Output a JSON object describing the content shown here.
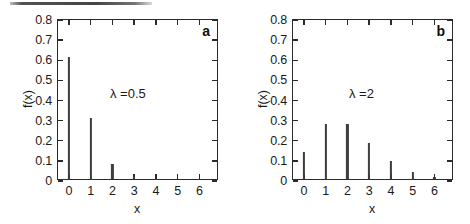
{
  "figure": {
    "background": "#ffffff",
    "axis_color": "#2b2b2b",
    "stem_color": "#3d3d3d"
  },
  "artifact": {
    "name": "scan-line"
  },
  "panels": [
    {
      "letter": "a",
      "lambda_label": "λ =0.5",
      "xlabel": "x",
      "ylabel": "f(x)"
    },
    {
      "letter": "b",
      "lambda_label": "λ =2",
      "xlabel": "x",
      "ylabel": "f(x)"
    }
  ],
  "axes": {
    "y_ticks": [
      "0",
      "0.1",
      "0.2",
      "0.3",
      "0.4",
      "0.5",
      "0.6",
      "0.7",
      "0.8"
    ],
    "y_tick_values": [
      0,
      0.1,
      0.2,
      0.3,
      0.4,
      0.5,
      0.6,
      0.7,
      0.8
    ],
    "x_ticks": [
      "0",
      "1",
      "2",
      "3",
      "4",
      "5",
      "6"
    ],
    "x_tick_values": [
      0,
      1,
      2,
      3,
      4,
      5,
      6
    ]
  },
  "chart_data": [
    {
      "type": "bar",
      "title": "a",
      "annotation": "λ =0.5",
      "xlabel": "x",
      "ylabel": "f(x)",
      "categories": [
        "0",
        "1",
        "2",
        "3",
        "4",
        "5",
        "6"
      ],
      "x": [
        0,
        1,
        2,
        3,
        4,
        5,
        6
      ],
      "values": [
        0.607,
        0.303,
        0.076,
        0.013,
        0.002,
        0.0,
        0.0
      ],
      "xlim": [
        -0.5,
        6.9
      ],
      "ylim": [
        0,
        0.8
      ],
      "grid": false,
      "legend": "none"
    },
    {
      "type": "bar",
      "title": "b",
      "annotation": "λ =2",
      "xlabel": "x",
      "ylabel": "f(x)",
      "categories": [
        "0",
        "1",
        "2",
        "3",
        "4",
        "5",
        "6"
      ],
      "x": [
        0,
        1,
        2,
        3,
        4,
        5,
        6
      ],
      "values": [
        0.135,
        0.271,
        0.271,
        0.18,
        0.09,
        0.036,
        0.012
      ],
      "xlim": [
        -0.5,
        6.9
      ],
      "ylim": [
        0,
        0.8
      ],
      "grid": false,
      "legend": "none"
    }
  ]
}
